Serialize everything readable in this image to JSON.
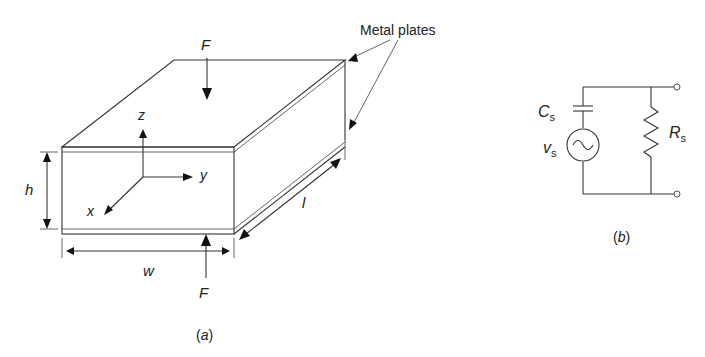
{
  "figure_a": {
    "caption": "(a)",
    "labels": {
      "force_top": "F",
      "force_bottom": "F",
      "metal_plates": "Metal plates",
      "height": "h",
      "width": "w",
      "length": "l",
      "axis_x": "x",
      "axis_y": "y",
      "axis_z": "z"
    }
  },
  "figure_b": {
    "caption": "(b)",
    "labels": {
      "capacitor": "C",
      "capacitor_sub": "s",
      "source": "v",
      "source_sub": "s",
      "resistor": "R",
      "resistor_sub": "s"
    }
  }
}
